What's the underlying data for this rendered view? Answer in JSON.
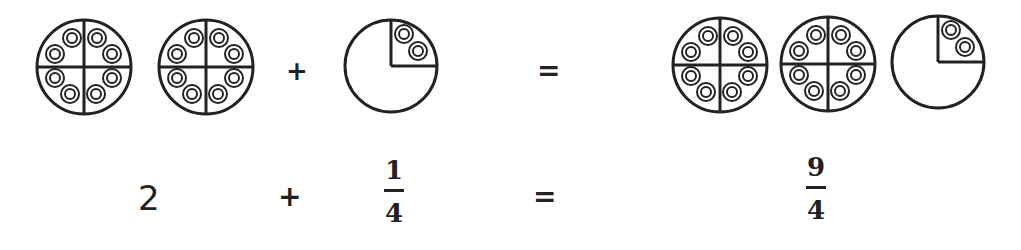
{
  "top_row": {
    "pictures": [
      {
        "id": "whole-1",
        "type": "whole_circle",
        "quarters": 4,
        "counters_per_quarter": 2
      },
      {
        "id": "whole-2",
        "type": "whole_circle",
        "quarters": 4,
        "counters_per_quarter": 2
      },
      {
        "id": "quarter-1",
        "type": "one_quarter_circle",
        "quarters": 1,
        "counters_per_quarter": 2
      },
      {
        "id": "result-whole-1",
        "type": "whole_circle",
        "quarters": 4,
        "counters_per_quarter": 2
      },
      {
        "id": "result-whole-2",
        "type": "whole_circle",
        "quarters": 4,
        "counters_per_quarter": 2
      },
      {
        "id": "result-quarter",
        "type": "one_quarter_circle",
        "quarters": 1,
        "counters_per_quarter": 2
      }
    ],
    "plus": "+",
    "equals": "="
  },
  "bottom_row": {
    "whole": "2",
    "plus": "+",
    "addend": {
      "numerator": "1",
      "denominator": "4"
    },
    "equals": "=",
    "result": {
      "numerator": "9",
      "denominator": "4"
    }
  }
}
